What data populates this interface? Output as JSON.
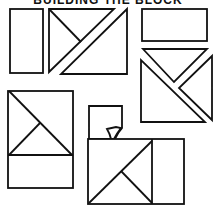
{
  "title": "BUILDING THE BLOCK",
  "colors": {
    "ink": "#111111",
    "paper": "#ffffff"
  },
  "pieces": [
    {
      "id": "tall-rectangle",
      "shape": "rectangle"
    },
    {
      "id": "split-triangles-top",
      "shape": "triangles"
    },
    {
      "id": "wide-rectangle",
      "shape": "rectangle"
    },
    {
      "id": "triangle-set-right",
      "shape": "triangles"
    },
    {
      "id": "assembled-half-block",
      "shape": "square-with-triangles"
    },
    {
      "id": "curled-square",
      "shape": "square",
      "detail": "curled corner"
    },
    {
      "id": "assembled-block",
      "shape": "rectangle-with-triangles"
    }
  ]
}
